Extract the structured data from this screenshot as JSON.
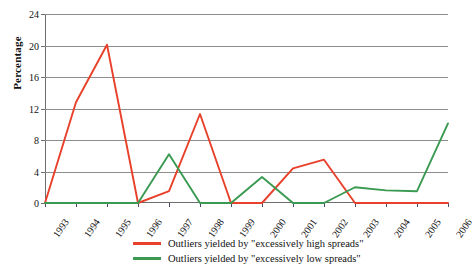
{
  "chart_data": {
    "type": "line",
    "title": "",
    "subtitle": "",
    "xlabel": "",
    "ylabel": "Percentage",
    "categories": [
      "1993",
      "1994",
      "1995",
      "1996",
      "1997",
      "1998",
      "1999",
      "2000",
      "2001",
      "2002",
      "2003",
      "2004",
      "2005",
      "2006"
    ],
    "x": [
      "1993",
      "1994",
      "1995",
      "1996",
      "1997",
      "1998",
      "1999",
      "2000",
      "2001",
      "2002",
      "2003",
      "2004",
      "2005",
      "2006"
    ],
    "ylim": [
      0,
      24
    ],
    "yticks": [
      0,
      4,
      8,
      12,
      16,
      20,
      24
    ],
    "ytick_labels": [
      "0",
      "4",
      "8",
      "12",
      "16",
      "20",
      "24"
    ],
    "grid": true,
    "grid_axis": "y",
    "legend_position": "bottom",
    "series": [
      {
        "name": "Outliers yielded by \"excessively high spreads\"",
        "color": "#E8402A",
        "values": [
          0,
          12.8,
          20.1,
          0,
          1.5,
          11.3,
          0,
          0,
          4.4,
          5.5,
          0,
          0,
          0,
          0
        ]
      },
      {
        "name": "Outliers yielded by \"excessively low spreads\"",
        "color": "#3A9A52",
        "values": [
          0,
          0,
          0,
          0,
          6.2,
          0,
          0,
          3.3,
          0,
          0,
          2.0,
          1.6,
          1.5,
          10.1
        ]
      }
    ]
  },
  "axes": {
    "y_title": "Percentage"
  },
  "legend": {
    "items": [
      {
        "label": "Outliers yielded by \"excessively high spreads\"",
        "color": "#E8402A"
      },
      {
        "label": "Outliers yielded by \"excessively low spreads\"",
        "color": "#3A9A52"
      }
    ]
  }
}
